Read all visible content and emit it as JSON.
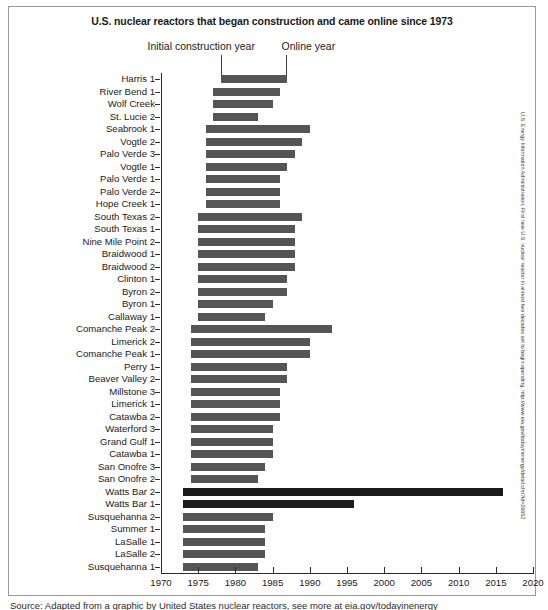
{
  "chart_data": {
    "type": "bar",
    "orientation": "horizontal-range",
    "title": "U.S. nuclear reactors that began construction and came online since 1973",
    "xlabel": "",
    "ylabel": "",
    "xlim": [
      1970,
      2020
    ],
    "xticks": [
      1970,
      1975,
      1980,
      1985,
      1990,
      1995,
      2000,
      2005,
      2010,
      2015,
      2020
    ],
    "grid": false,
    "legend": null,
    "annotations": [
      {
        "text": "Initial construction year",
        "points_to": "bar-left-edge"
      },
      {
        "text": "Online year",
        "points_to": "bar-right-edge"
      }
    ],
    "bar_color": "#555555",
    "highlight_color": "#1b1b1b",
    "value_label": "Construction start to online year",
    "categories": [
      "Harris 1",
      "River Bend 1",
      "Wolf Creek",
      "St. Lucie 2",
      "Seabrook 1",
      "Vogtle 2",
      "Palo Verde 3",
      "Vogtle 1",
      "Palo Verde 1",
      "Palo Verde 2",
      "Hope Creek 1",
      "South Texas 2",
      "South Texas 1",
      "Nine Mile Point 2",
      "Braidwood 1",
      "Braidwood 2",
      "Clinton 1",
      "Byron 2",
      "Byron 1",
      "Callaway 1",
      "Comanche Peak 2",
      "Limerick 2",
      "Comanche Peak 1",
      "Perry 1",
      "Beaver Valley 2",
      "Millstone 3",
      "Limerick 1",
      "Catawba 2",
      "Waterford 3",
      "Grand Gulf 1",
      "Catawba 1",
      "San Onofre 3",
      "San Onofre 2",
      "Watts Bar 2",
      "Watts Bar 1",
      "Susquehanna 2",
      "Summer 1",
      "LaSalle 1",
      "LaSalle 2",
      "Susquehanna 1"
    ],
    "series": [
      {
        "name": "Initial construction year",
        "values": [
          1978,
          1977,
          1977,
          1977,
          1976,
          1976,
          1976,
          1976,
          1976,
          1976,
          1976,
          1975,
          1975,
          1975,
          1975,
          1975,
          1975,
          1975,
          1975,
          1975,
          1974,
          1974,
          1974,
          1974,
          1974,
          1974,
          1974,
          1974,
          1974,
          1974,
          1974,
          1974,
          1974,
          1973,
          1973,
          1973,
          1973,
          1973,
          1973,
          1973
        ]
      },
      {
        "name": "Online year",
        "values": [
          1987,
          1986,
          1985,
          1983,
          1990,
          1989,
          1988,
          1987,
          1986,
          1986,
          1986,
          1989,
          1988,
          1988,
          1988,
          1988,
          1987,
          1987,
          1985,
          1984,
          1993,
          1990,
          1990,
          1987,
          1987,
          1986,
          1986,
          1986,
          1985,
          1985,
          1985,
          1984,
          1983,
          2016,
          1996,
          1985,
          1984,
          1984,
          1984,
          1983
        ]
      }
    ],
    "rows": [
      {
        "label": "Harris 1",
        "start": 1978,
        "end": 1987,
        "highlight": false
      },
      {
        "label": "River Bend 1",
        "start": 1977,
        "end": 1986,
        "highlight": false
      },
      {
        "label": "Wolf Creek",
        "start": 1977,
        "end": 1985,
        "highlight": false
      },
      {
        "label": "St. Lucie 2",
        "start": 1977,
        "end": 1983,
        "highlight": false
      },
      {
        "label": "Seabrook 1",
        "start": 1976,
        "end": 1990,
        "highlight": false
      },
      {
        "label": "Vogtle 2",
        "start": 1976,
        "end": 1989,
        "highlight": false
      },
      {
        "label": "Palo Verde 3",
        "start": 1976,
        "end": 1988,
        "highlight": false
      },
      {
        "label": "Vogtle 1",
        "start": 1976,
        "end": 1987,
        "highlight": false
      },
      {
        "label": "Palo Verde 1",
        "start": 1976,
        "end": 1986,
        "highlight": false
      },
      {
        "label": "Palo Verde 2",
        "start": 1976,
        "end": 1986,
        "highlight": false
      },
      {
        "label": "Hope Creek 1",
        "start": 1976,
        "end": 1986,
        "highlight": false
      },
      {
        "label": "South Texas 2",
        "start": 1975,
        "end": 1989,
        "highlight": false
      },
      {
        "label": "South Texas 1",
        "start": 1975,
        "end": 1988,
        "highlight": false
      },
      {
        "label": "Nine Mile Point 2",
        "start": 1975,
        "end": 1988,
        "highlight": false
      },
      {
        "label": "Braidwood 1",
        "start": 1975,
        "end": 1988,
        "highlight": false
      },
      {
        "label": "Braidwood 2",
        "start": 1975,
        "end": 1988,
        "highlight": false
      },
      {
        "label": "Clinton 1",
        "start": 1975,
        "end": 1987,
        "highlight": false
      },
      {
        "label": "Byron 2",
        "start": 1975,
        "end": 1987,
        "highlight": false
      },
      {
        "label": "Byron 1",
        "start": 1975,
        "end": 1985,
        "highlight": false
      },
      {
        "label": "Callaway 1",
        "start": 1975,
        "end": 1984,
        "highlight": false
      },
      {
        "label": "Comanche Peak 2",
        "start": 1974,
        "end": 1993,
        "highlight": false
      },
      {
        "label": "Limerick 2",
        "start": 1974,
        "end": 1990,
        "highlight": false
      },
      {
        "label": "Comanche Peak 1",
        "start": 1974,
        "end": 1990,
        "highlight": false
      },
      {
        "label": "Perry 1",
        "start": 1974,
        "end": 1987,
        "highlight": false
      },
      {
        "label": "Beaver Valley 2",
        "start": 1974,
        "end": 1987,
        "highlight": false
      },
      {
        "label": "Millstone 3",
        "start": 1974,
        "end": 1986,
        "highlight": false
      },
      {
        "label": "Limerick 1",
        "start": 1974,
        "end": 1986,
        "highlight": false
      },
      {
        "label": "Catawba 2",
        "start": 1974,
        "end": 1986,
        "highlight": false
      },
      {
        "label": "Waterford 3",
        "start": 1974,
        "end": 1985,
        "highlight": false
      },
      {
        "label": "Grand Gulf 1",
        "start": 1974,
        "end": 1985,
        "highlight": false
      },
      {
        "label": "Catawba 1",
        "start": 1974,
        "end": 1985,
        "highlight": false
      },
      {
        "label": "San Onofre 3",
        "start": 1974,
        "end": 1984,
        "highlight": false
      },
      {
        "label": "San Onofre 2",
        "start": 1974,
        "end": 1983,
        "highlight": false
      },
      {
        "label": "Watts Bar 2",
        "start": 1973,
        "end": 2016,
        "highlight": true
      },
      {
        "label": "Watts Bar 1",
        "start": 1973,
        "end": 1996,
        "highlight": true
      },
      {
        "label": "Susquehanna 2",
        "start": 1973,
        "end": 1985,
        "highlight": false
      },
      {
        "label": "Summer 1",
        "start": 1973,
        "end": 1984,
        "highlight": false
      },
      {
        "label": "LaSalle 1",
        "start": 1973,
        "end": 1984,
        "highlight": false
      },
      {
        "label": "LaSalle 2",
        "start": 1973,
        "end": 1984,
        "highlight": false
      },
      {
        "label": "Susquehanna 1",
        "start": 1973,
        "end": 1983,
        "highlight": false
      }
    ]
  },
  "source_note": "U.S. Energy Information Administration, First new U.S. nuclear reactor in almost two decades set to begin operating, http://www.eia.gov/todayinenergy/detail.cfm?id=26652",
  "caption": "Source: Adapted from a graphic by United States nuclear reactors, see more at eia.gov/todayinenergy"
}
